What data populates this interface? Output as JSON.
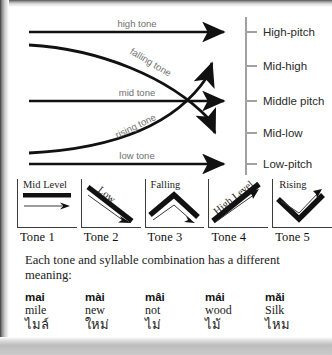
{
  "diagram": {
    "pitch_levels": [
      {
        "label": "High-pitch"
      },
      {
        "label": "Mid-high"
      },
      {
        "label": "Middle pitch"
      },
      {
        "label": "Mid-low"
      },
      {
        "label": "Low-pitch"
      }
    ],
    "contours": [
      {
        "name": "high-tone",
        "label": "high tone"
      },
      {
        "name": "falling-tone",
        "label": "falling tone"
      },
      {
        "name": "mid-tone",
        "label": "mid tone"
      },
      {
        "name": "rising-tone",
        "label": "rising tone"
      },
      {
        "name": "low-tone",
        "label": "low tone"
      }
    ]
  },
  "tone_boxes": [
    {
      "word": "Mid Level",
      "caption": "Tone 1"
    },
    {
      "word": "Low",
      "caption": "Tone 2"
    },
    {
      "word": "Falling",
      "caption": "Tone 3"
    },
    {
      "word": "High Level",
      "caption": "Tone 4"
    },
    {
      "word": "Rising",
      "caption": "Tone 5"
    }
  ],
  "prose": {
    "text": "Each tone and syllable combination has a different meaning:"
  },
  "words": [
    {
      "roman": "mai",
      "gloss": "mile",
      "thai": "ไมล์"
    },
    {
      "roman": "mài",
      "gloss": "new",
      "thai": "ใหม่"
    },
    {
      "roman": "mâi",
      "gloss": "not",
      "thai": "ไม่"
    },
    {
      "roman": "mái",
      "gloss": "wood",
      "thai": "ไม้"
    },
    {
      "roman": "mǎi",
      "gloss": "Silk",
      "thai": "ไหม"
    }
  ],
  "colors": {
    "ink": "#111111",
    "label_grey": "#6f6f6f",
    "axis": "#7a7a7a",
    "page": "#ffffff"
  }
}
